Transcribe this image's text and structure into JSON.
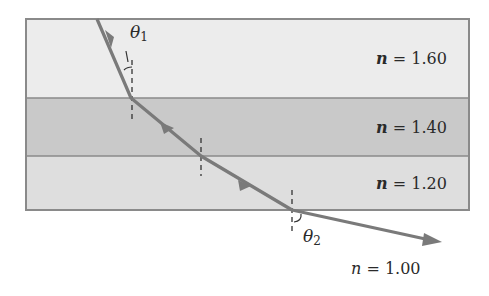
{
  "diagram": {
    "type": "refraction-through-layers",
    "layers": [
      {
        "name": "layer-1",
        "n_label": "n",
        "n_value": "1.60",
        "color": "#ececec",
        "y_top": 19,
        "y_bottom": 98
      },
      {
        "name": "layer-2",
        "n_label": "n",
        "n_value": "1.40",
        "color": "#c9c9c9",
        "y_top": 98,
        "y_bottom": 156
      },
      {
        "name": "layer-3",
        "n_label": "n",
        "n_value": "1.20",
        "color": "#dedede",
        "y_top": 156,
        "y_bottom": 210
      }
    ],
    "outside": {
      "n_label": "n",
      "n_value": "1.00"
    },
    "angles": {
      "theta1": {
        "symbol": "θ",
        "subscript": "1"
      },
      "theta2": {
        "symbol": "θ",
        "subscript": "2"
      }
    },
    "ray_color": "#7a7a7a",
    "border_color": "#8a8a8a",
    "equals": "="
  }
}
